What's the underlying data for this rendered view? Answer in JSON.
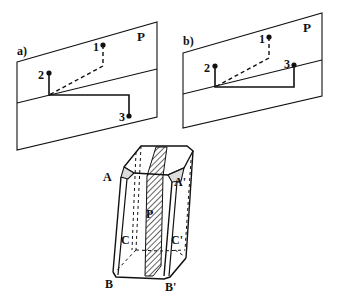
{
  "panel_a": {
    "label": "a)",
    "plane_label": "P",
    "points": [
      {
        "id": "1",
        "label": "1"
      },
      {
        "id": "2",
        "label": "2"
      },
      {
        "id": "3",
        "label": "3"
      }
    ]
  },
  "panel_b": {
    "label": "b)",
    "plane_label": "P",
    "points": [
      {
        "id": "1",
        "label": "1"
      },
      {
        "id": "2",
        "label": "2"
      },
      {
        "id": "3",
        "label": "3"
      }
    ]
  },
  "crystal": {
    "labels": {
      "A": "A",
      "A_prime": "A'",
      "P": "P",
      "C": "C",
      "C_prime": "C'",
      "B": "B",
      "B_prime": "B'"
    }
  },
  "colors": {
    "stroke": "#111111",
    "background": "#ffffff"
  }
}
